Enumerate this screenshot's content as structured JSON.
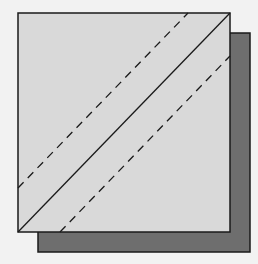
{
  "diagram": {
    "colors": {
      "background": "#f2f2f2",
      "front_fill": "#d9d9d9",
      "back_fill": "#6e6e6e",
      "stroke": "#1a1a1a"
    },
    "back_square": {
      "x": 38,
      "y": 33,
      "width": 212,
      "height": 219
    },
    "front_square": {
      "x": 18,
      "y": 13,
      "width": 212,
      "height": 219
    },
    "solid_diagonal": {
      "x1": 18,
      "y1": 232,
      "x2": 230,
      "y2": 13
    },
    "dashed_lines": [
      {
        "x1": 18,
        "y1": 188,
        "x2": 188,
        "y2": 13
      },
      {
        "x1": 60,
        "y1": 232,
        "x2": 230,
        "y2": 56
      }
    ]
  }
}
